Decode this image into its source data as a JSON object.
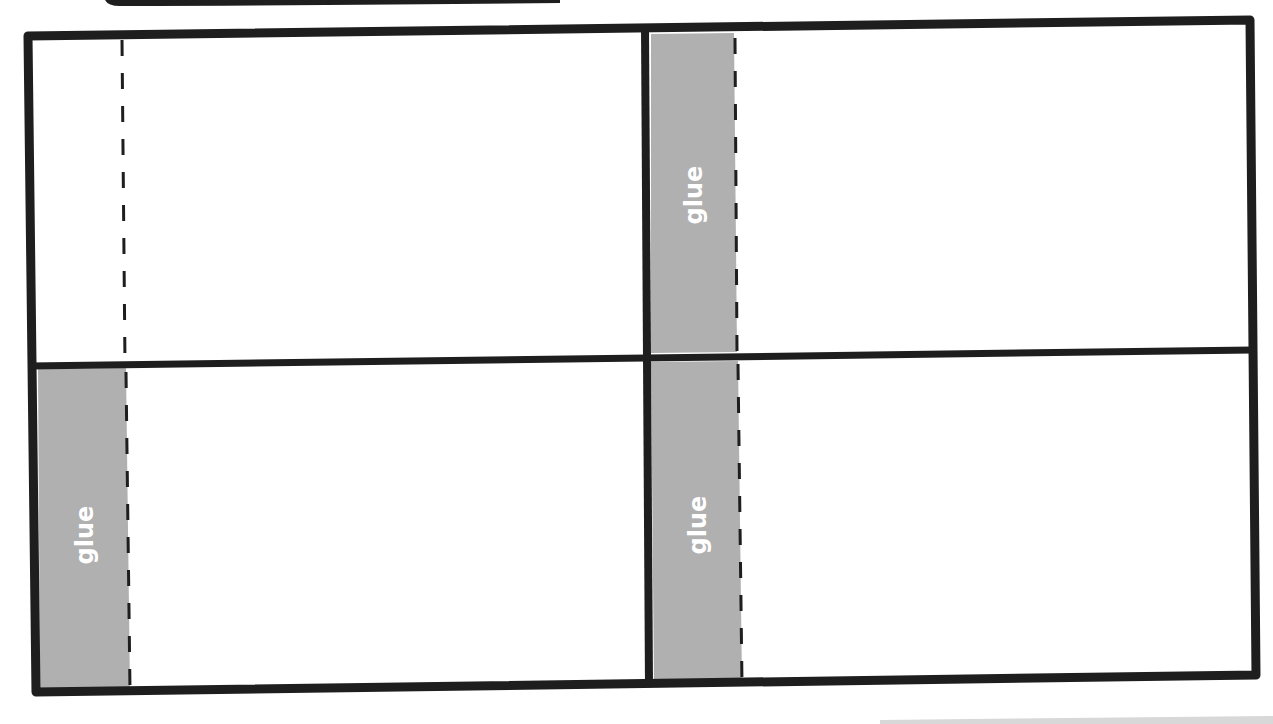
{
  "template": {
    "type": "fold-and-glue cutout",
    "panels": 4,
    "glue_tabs": [
      {
        "id": "top-right",
        "label": "glue"
      },
      {
        "id": "bottom-left",
        "label": "glue"
      },
      {
        "id": "bottom-right",
        "label": "glue"
      }
    ],
    "fold_lines": [
      "top-left",
      "top-right",
      "bottom-left",
      "bottom-right"
    ],
    "colors": {
      "outline": "#1e1e1e",
      "glue_fill": "#b0b0b0",
      "glue_text": "#ffffff",
      "paper": "#ffffff"
    }
  }
}
